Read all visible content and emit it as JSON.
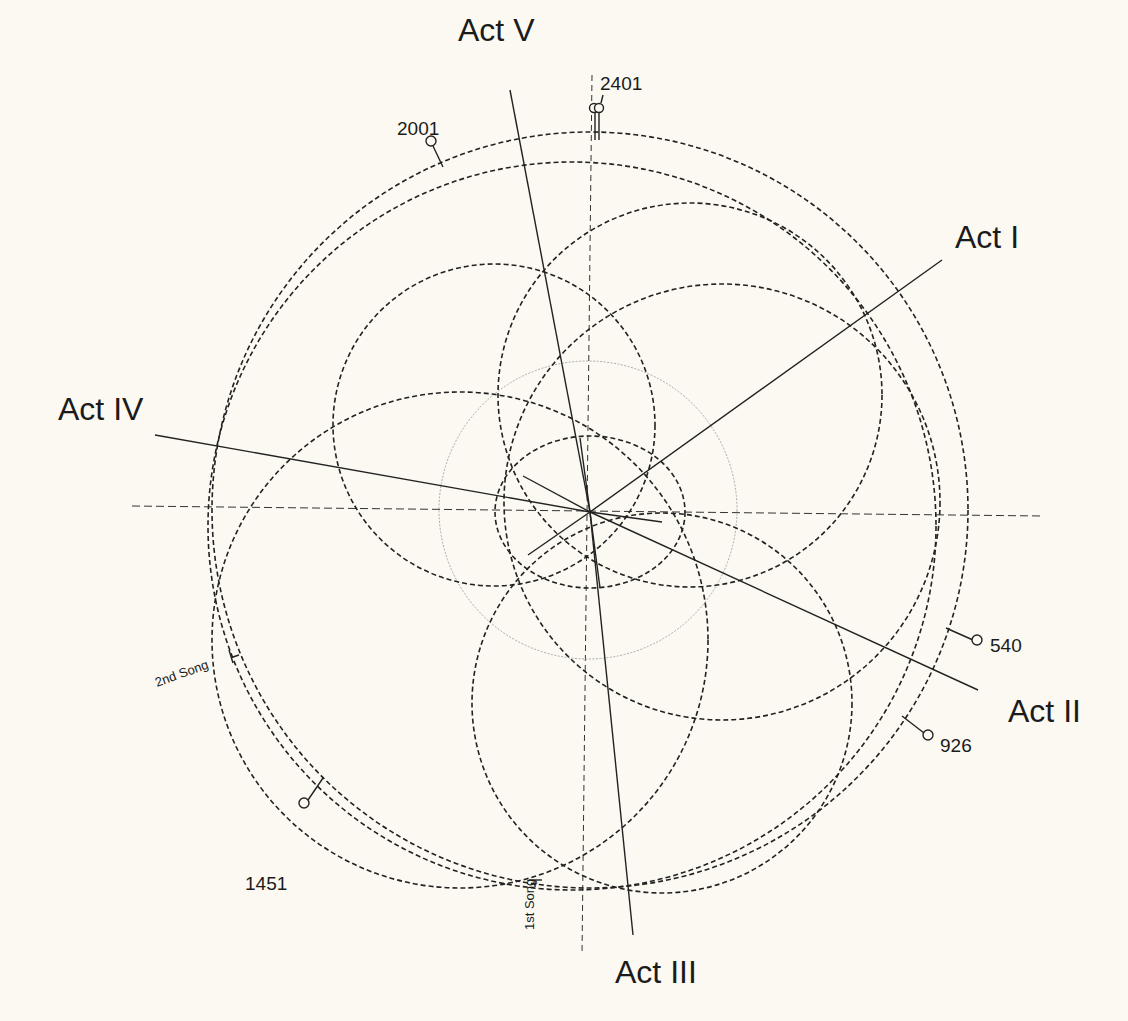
{
  "diagram": {
    "center": {
      "x": 590,
      "y": 512
    },
    "colors": {
      "background": "#fbf9f1",
      "ink": "#222222",
      "faint_circle": "#a9a9a9"
    },
    "acts": [
      {
        "label": "Act I",
        "text_x": 955,
        "text_y": 248
      },
      {
        "label": "Act II",
        "text_x": 1008,
        "text_y": 722
      },
      {
        "label": "Act III",
        "text_x": 615,
        "text_y": 983
      },
      {
        "label": "Act IV",
        "text_x": 58,
        "text_y": 420
      },
      {
        "label": "Act V",
        "text_x": 458,
        "text_y": 41
      }
    ],
    "markers": [
      {
        "label": "2401",
        "text_x": 600,
        "text_y": 90
      },
      {
        "label": "2001",
        "text_x": 397,
        "text_y": 135
      },
      {
        "label": "540",
        "text_x": 990,
        "text_y": 652
      },
      {
        "label": "926",
        "text_x": 940,
        "text_y": 752
      },
      {
        "label": "1451",
        "text_x": 245,
        "text_y": 890
      }
    ],
    "songs": [
      {
        "label": "2nd Song"
      },
      {
        "label": "1st Song"
      }
    ]
  }
}
